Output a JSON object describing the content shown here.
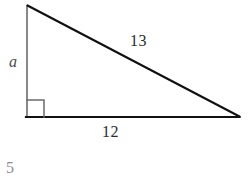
{
  "figure": {
    "type": "right-triangle",
    "labels": {
      "leg_vertical": "a",
      "base_horizontal": "12",
      "hypotenuse": "13"
    },
    "right_angle_marker": "right-angle-square",
    "geometry": {
      "apex": {
        "x": 27,
        "y": 5
      },
      "right_angle_vertex": {
        "x": 26,
        "y": 117
      },
      "far_vertex": {
        "x": 239,
        "y": 117
      },
      "square_size": 17
    },
    "colors": {
      "background": "#ffffff",
      "hypotenuse_stroke": "#111111",
      "base_stroke": "#111111",
      "leg_stroke": "#6b6b6b",
      "right_angle_stroke": "#6b6b6b",
      "number_text": "#2b2b2b",
      "variable_text": "#4a4a4a",
      "answer_text": "#8e8e8e"
    }
  },
  "caption": {
    "answer": "5"
  }
}
